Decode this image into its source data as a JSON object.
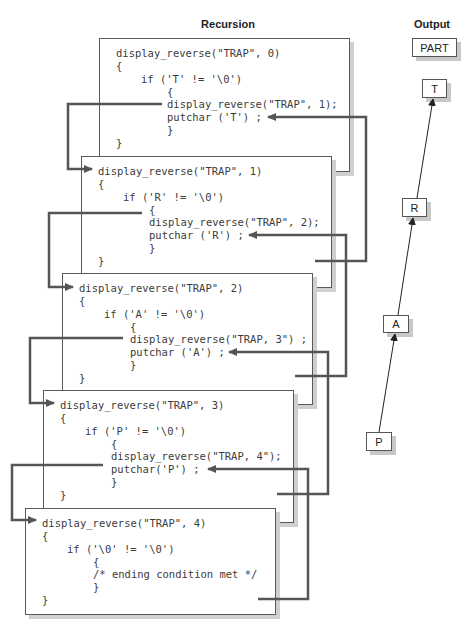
{
  "diagram": {
    "recursion_title": "Recursion",
    "output_title": "Output",
    "output_result": "PART",
    "output_chars": [
      "T",
      "R",
      "A",
      "P"
    ],
    "frames": [
      {
        "lines": [
          "display_reverse(\"TRAP\", 0)",
          "{",
          "if ('T' != '\\0')",
          "{",
          "display_reverse(\"TRAP\", 1);",
          "putchar ('T') ;",
          "}",
          "}"
        ]
      },
      {
        "lines": [
          "display_reverse(\"TRAP\", 1)",
          "{",
          "if ('R' != '\\0')",
          "{",
          "display_reverse(\"TRAP\", 2);",
          "putchar ('R') ;",
          "}",
          "}"
        ]
      },
      {
        "lines": [
          "display_reverse(\"TRAP\", 2)",
          "{",
          "if ('A' != '\\0')",
          "{",
          "display_reverse(\"TRAP, 3\") ;",
          "putchar ('A') ;",
          "}",
          "}"
        ]
      },
      {
        "lines": [
          "display_reverse(\"TRAP\", 3)",
          "{",
          "if ('P' != '\\0')",
          "{",
          "display_reverse(\"TRAP, 4\");",
          "putchar('P') ;",
          "}",
          "}"
        ]
      },
      {
        "lines": [
          "display_reverse(\"TRAP\", 4)",
          "{",
          "if ('\\0' != '\\0')",
          "{",
          "/* ending condition met */",
          "}",
          "}"
        ]
      }
    ],
    "colors": {
      "connector": "#555555",
      "frame_border": "#5a5a5a",
      "shadow": "#cfcfcf",
      "output_arrow": "#222222"
    }
  }
}
